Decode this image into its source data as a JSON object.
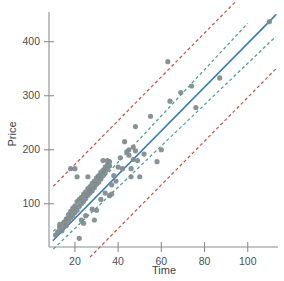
{
  "chart_data": {
    "type": "scatter",
    "title": "",
    "xlabel": "Time",
    "ylabel": "Price",
    "xlim": [
      8,
      114
    ],
    "ylim": [
      20,
      455
    ],
    "grid": false,
    "legend": null,
    "xticks": [
      20,
      40,
      60,
      80,
      100
    ],
    "yticks": [
      100,
      200,
      300,
      400
    ],
    "xtick_labels": [
      "20",
      "40",
      "60",
      "80",
      "100"
    ],
    "ytick_labels": [
      "100",
      "200",
      "300",
      "400"
    ],
    "point_color": "#7f8a8d",
    "fit_color": "#3b7fb5",
    "confidence_color": "#4f9e8c",
    "prediction_color": "#c4564a",
    "series": [
      {
        "name": "observations",
        "marker": "circle",
        "color": "#7f8a8d",
        "points": [
          [
            11,
            42
          ],
          [
            12,
            48
          ],
          [
            13,
            55
          ],
          [
            13,
            62
          ],
          [
            14,
            50
          ],
          [
            15,
            66
          ],
          [
            15,
            58
          ],
          [
            16,
            72
          ],
          [
            16,
            60
          ],
          [
            17,
            80
          ],
          [
            17,
            68
          ],
          [
            18,
            86
          ],
          [
            18,
            74
          ],
          [
            18,
            165
          ],
          [
            19,
            92
          ],
          [
            19,
            78
          ],
          [
            20,
            96
          ],
          [
            20,
            84
          ],
          [
            20,
            165
          ],
          [
            21,
            104
          ],
          [
            21,
            88
          ],
          [
            21,
            150
          ],
          [
            22,
            108
          ],
          [
            22,
            95
          ],
          [
            22,
            36
          ],
          [
            23,
            112
          ],
          [
            23,
            100
          ],
          [
            23,
            70
          ],
          [
            24,
            118
          ],
          [
            24,
            104
          ],
          [
            24,
            64
          ],
          [
            25,
            122
          ],
          [
            25,
            110
          ],
          [
            25,
            78
          ],
          [
            26,
            128
          ],
          [
            26,
            116
          ],
          [
            26,
            150
          ],
          [
            27,
            132
          ],
          [
            27,
            120
          ],
          [
            27,
            126
          ],
          [
            28,
            138
          ],
          [
            28,
            124
          ],
          [
            28,
            90
          ],
          [
            29,
            142
          ],
          [
            29,
            130
          ],
          [
            29,
            70
          ],
          [
            30,
            148
          ],
          [
            30,
            136
          ],
          [
            30,
            88
          ],
          [
            31,
            152
          ],
          [
            31,
            140
          ],
          [
            31,
            150
          ],
          [
            32,
            158
          ],
          [
            32,
            146
          ],
          [
            32,
            108
          ],
          [
            33,
            162
          ],
          [
            33,
            152
          ],
          [
            33,
            180
          ],
          [
            34,
            168
          ],
          [
            34,
            158
          ],
          [
            34,
            120
          ],
          [
            35,
            172
          ],
          [
            35,
            164
          ],
          [
            35,
            180
          ],
          [
            36,
            178
          ],
          [
            36,
            170
          ],
          [
            36,
            115
          ],
          [
            37,
            118
          ],
          [
            37,
            135
          ],
          [
            38,
            152
          ],
          [
            39,
            142
          ],
          [
            40,
            168
          ],
          [
            41,
            185
          ],
          [
            42,
            165
          ],
          [
            43,
            215
          ],
          [
            44,
            196
          ],
          [
            45,
            190
          ],
          [
            45,
            200
          ],
          [
            46,
            165
          ],
          [
            46,
            150
          ],
          [
            47,
            205
          ],
          [
            47,
            182
          ],
          [
            48,
            243
          ],
          [
            48,
            198
          ],
          [
            49,
            180
          ],
          [
            50,
            150
          ],
          [
            52,
            192
          ],
          [
            55,
            262
          ],
          [
            58,
            178
          ],
          [
            60,
            200
          ],
          [
            63,
            363
          ],
          [
            64,
            290
          ],
          [
            69,
            306
          ],
          [
            74,
            318
          ],
          [
            76,
            278
          ],
          [
            87,
            333
          ],
          [
            110,
            437
          ]
        ]
      }
    ],
    "lines": [
      {
        "name": "regression-fit",
        "style": "solid",
        "color": "#3b7fb5",
        "slope": 4.05,
        "intercept": -8,
        "x_range": [
          10,
          113
        ]
      },
      {
        "name": "confidence-upper",
        "style": "dashed",
        "color": "#4f9e8c",
        "slope": 4.28,
        "intercept": 6,
        "x_range": [
          10,
          100
        ]
      },
      {
        "name": "confidence-lower",
        "style": "dashed",
        "color": "#4f9e8c",
        "slope": 3.82,
        "intercept": -22,
        "x_range": [
          10,
          113
        ]
      },
      {
        "name": "prediction-upper",
        "style": "dashed",
        "color": "#c4564a",
        "slope": 4.05,
        "intercept": 92,
        "x_range": [
          10,
          94
        ]
      },
      {
        "name": "prediction-lower",
        "style": "dashed",
        "color": "#c4564a",
        "slope": 4.05,
        "intercept": -108,
        "x_range": [
          27,
          113
        ]
      }
    ]
  },
  "axes": {
    "x_title": "Time",
    "y_title": "Price"
  }
}
